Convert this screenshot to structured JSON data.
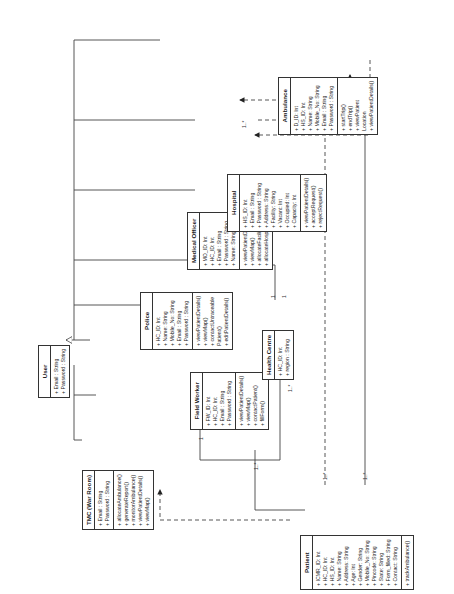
{
  "diagram": {
    "type": "UML class diagram (rotated 90°)",
    "classes": {
      "user": {
        "name": "User",
        "attributes": [
          "+ Email : String",
          "+ Password : String"
        ],
        "methods": []
      },
      "tmc": {
        "name": "TMC (War Room)",
        "attributes": [
          "+ Email : String",
          "+ Password : String"
        ],
        "methods": [
          "+ allocateAmbulance()",
          "+ generateReport()",
          "+ monitorAmbulance()",
          "+ viewPatientDetails()",
          "+ viewMap()"
        ]
      },
      "field_worker": {
        "name": "Field Worker",
        "attributes": [
          "+ FW_ID: Int",
          "+ HC_ID: Int",
          "+ Email : String",
          "+ Password : String"
        ],
        "methods": [
          "+ viewPatientDetails()",
          "+ viewMap()",
          "+ contactPatient()",
          "+ fillForm()"
        ]
      },
      "police": {
        "name": "Police",
        "attributes": [
          "+ HC_ID: Int",
          "+ Name: String",
          "+ Mobile_No: String",
          "+ Email : String",
          "+ Password : String"
        ],
        "methods": [
          "+ viewPatientDetails()",
          "+ viewMap()",
          "+ contactUntraceable",
          "  Patient()",
          "+ editPatientDetails()"
        ]
      },
      "medical_officer": {
        "name": "Medical Officer",
        "attributes": [
          "+ MO_ID: Int",
          "+ HC_ID: Int",
          "+ Email : String",
          "+ Password : String",
          "+ Name: String"
        ],
        "methods": [
          "+ viewPatientDetails()",
          "+ viewMap()",
          "+ allocateFacility()",
          "+ allocateHospital()"
        ]
      },
      "hospital": {
        "name": "Hospital",
        "attributes": [
          "+ HS_ID: Int",
          "+ Email : String",
          "+ Password : String",
          "+ Address: String",
          "+ Facility: String",
          "+ Vacant: Int",
          "+ Occupied: Int",
          "+ Capacity: Int"
        ],
        "methods": [
          "+ viewPatientDetails()",
          "+ acceptRequest()",
          "+ rejectRequest()"
        ]
      },
      "ambulance": {
        "name": "Ambulance",
        "attributes": [
          "+ D_ID: Int",
          "+ HS_ID: Int",
          "+ Name: String",
          "+ Mobile_No: String",
          "+ Email : String",
          "+ Password : String"
        ],
        "methods": [
          "+ startTrip()",
          "+ endTrip()",
          "+ viewPatient",
          "  Location",
          "+ viewPatientDetails()"
        ]
      },
      "health_centre": {
        "name": "Health Centre",
        "attributes": [
          "+ HC_ID: Int",
          "+ region : String"
        ],
        "methods": []
      },
      "patient": {
        "name": "Patient",
        "attributes": [
          "+ ICMR_ID: Int",
          "+ HC_ID: Int",
          "+ HS_ID: Int",
          "+ Name: String",
          "+ Address: String",
          "+ Age: Int",
          "+ Gender: String",
          "+ Mobile_No: String",
          "+ Pincode: String",
          "+ State: String",
          "+ Form_filled: String",
          "+ Contact: String"
        ],
        "methods": [
          "+ trackAmbulance()"
        ]
      }
    },
    "multiplicities": {
      "m1": "1..*",
      "m2": "1..*",
      "m3": "1..*",
      "m4": "1..*",
      "m5": "1..*",
      "m6": "1",
      "m7": "1",
      "m8": "1",
      "m9": "1..*"
    }
  }
}
